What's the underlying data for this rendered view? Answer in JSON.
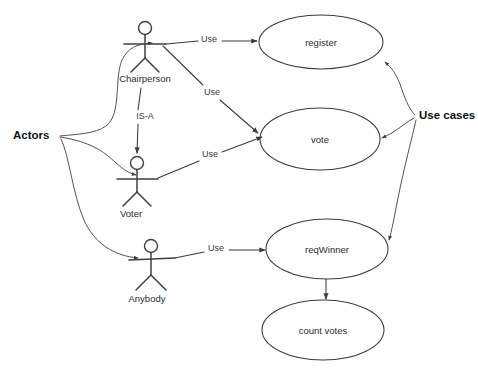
{
  "diagram": {
    "kind": "uml-use-case-diagram",
    "background_color": "#ffffff",
    "line_color": "#3a3a3a",
    "text_color": "#2b2b2b",
    "annotations": [
      {
        "id": "actors",
        "label": "Actors",
        "x": 13,
        "y": 136
      },
      {
        "id": "use-cases",
        "label": "Use cases",
        "x": 419,
        "y": 116
      }
    ],
    "actors": [
      {
        "id": "chairperson",
        "label": "Chairperson",
        "cx": 145,
        "cy": 28,
        "label_x": 145,
        "label_y": 79
      },
      {
        "id": "voter",
        "label": "Voter",
        "cx": 137,
        "cy": 163,
        "label_x": 131,
        "label_y": 214
      },
      {
        "id": "anybody",
        "label": "Anybody",
        "cx": 151,
        "cy": 246,
        "label_x": 147,
        "label_y": 299
      }
    ],
    "use_cases": [
      {
        "id": "register",
        "label": "register",
        "cx": 321,
        "cy": 42,
        "rx": 62,
        "ry": 27
      },
      {
        "id": "vote",
        "label": "vote",
        "cx": 320,
        "cy": 139,
        "rx": 60,
        "ry": 31
      },
      {
        "id": "reqwinner",
        "label": "reqWinner",
        "cx": 327,
        "cy": 249,
        "rx": 61,
        "ry": 30
      },
      {
        "id": "count-votes",
        "label": "count votes",
        "cx": 323,
        "cy": 330,
        "rx": 61,
        "ry": 30
      }
    ],
    "edges": [
      {
        "id": "chairperson-register",
        "label": "Use",
        "label_x": 209,
        "label_y": 40,
        "from": "chairperson",
        "to": "register"
      },
      {
        "id": "chairperson-vote",
        "label": "Use",
        "label_x": 212,
        "label_y": 93,
        "from": "chairperson",
        "to": "vote"
      },
      {
        "id": "voter-vote",
        "label": "Use",
        "label_x": 210,
        "label_y": 155,
        "from": "voter",
        "to": "vote"
      },
      {
        "id": "anybody-reqwinner",
        "label": "Use",
        "label_x": 216,
        "label_y": 249,
        "from": "anybody",
        "to": "reqwinner"
      },
      {
        "id": "chairperson-isa-voter",
        "label": "IS-A",
        "label_x": 145,
        "label_y": 117,
        "from": "chairperson",
        "to": "voter"
      },
      {
        "id": "reqwinner-countvotes",
        "label": "",
        "label_x": 0,
        "label_y": 0,
        "from": "reqwinner",
        "to": "count-votes"
      }
    ]
  }
}
